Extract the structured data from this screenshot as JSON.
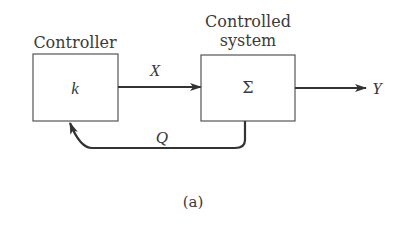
{
  "diagram": {
    "type": "block-diagram",
    "caption": "(a)",
    "blocks": [
      {
        "id": "controller",
        "title": "Controller",
        "symbol": "k"
      },
      {
        "id": "controlled-system",
        "title_line1": "Controlled",
        "title_line2": "system",
        "symbol": "Σ"
      }
    ],
    "signals": {
      "forward": "X",
      "output": "Y",
      "feedback": "Q"
    },
    "edges": [
      {
        "from": "controller",
        "to": "controlled-system",
        "label": "X"
      },
      {
        "from": "controlled-system",
        "to": "output",
        "label": "Y"
      },
      {
        "from": "controlled-system",
        "to": "controller",
        "label": "Q",
        "kind": "feedback"
      }
    ],
    "colors": {
      "stroke": "#3a3a3a",
      "line": "#333333",
      "background": "#ffffff"
    }
  }
}
